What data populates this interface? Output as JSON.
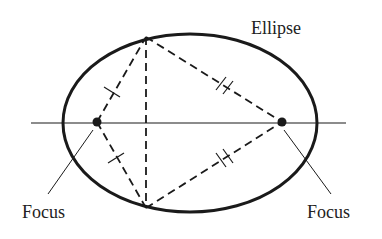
{
  "diagram": {
    "title_label": "Ellipse",
    "labels": {
      "left_focus": "Focus",
      "right_focus": "Focus"
    },
    "colors": {
      "stroke": "#1a1a1a",
      "background": "#ffffff"
    },
    "ellipse": {
      "cx": 190,
      "cy": 123,
      "rx": 127,
      "ry": 89
    },
    "foci": [
      {
        "name": "left",
        "x": 97,
        "y": 122
      },
      {
        "name": "right",
        "x": 282,
        "y": 122
      }
    ],
    "vertices": {
      "top": {
        "x": 146,
        "y": 37
      },
      "bottom": {
        "x": 146,
        "y": 208
      }
    },
    "tick_marks": {
      "left_segments": "single",
      "right_segments": "double"
    }
  }
}
